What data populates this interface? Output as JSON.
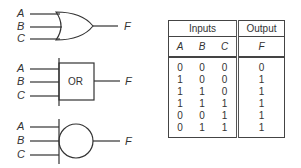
{
  "gates": [
    {
      "name": "or-gate-distinctive-shape",
      "inputs": [
        "A",
        "B",
        "C"
      ],
      "output": "F",
      "symbol_text": ""
    },
    {
      "name": "or-gate-rectangular",
      "inputs": [
        "A",
        "B",
        "C"
      ],
      "output": "F",
      "symbol_text": "OR"
    },
    {
      "name": "or-gate-circle",
      "inputs": [
        "A",
        "B",
        "C"
      ],
      "output": "F",
      "symbol_text": ""
    }
  ],
  "truth_table": {
    "group_headers": {
      "inputs": "Inputs",
      "output": "Output"
    },
    "columns": [
      "A",
      "B",
      "C",
      "F"
    ],
    "rows": [
      [
        "0",
        "0",
        "0",
        "0"
      ],
      [
        "1",
        "0",
        "0",
        "1"
      ],
      [
        "1",
        "1",
        "0",
        "1"
      ],
      [
        "1",
        "1",
        "1",
        "1"
      ],
      [
        "0",
        "0",
        "1",
        "1"
      ],
      [
        "0",
        "1",
        "1",
        "1"
      ]
    ]
  }
}
